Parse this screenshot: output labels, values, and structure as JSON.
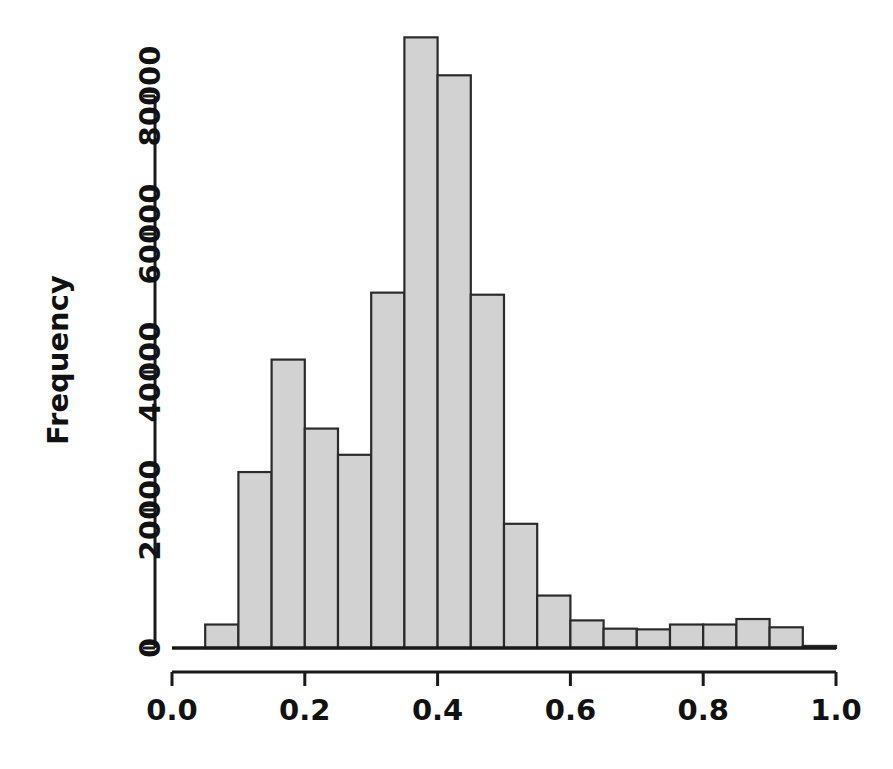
{
  "chart_data": {
    "type": "bar",
    "title": "",
    "subtitle": "",
    "xlabel": "",
    "ylabel": "Frequency",
    "grid": false,
    "legend": null,
    "legend_position": "none",
    "bin_width": 0.05,
    "xlim": [
      0.0,
      1.0
    ],
    "ylim": [
      0,
      88000
    ],
    "xticks": [
      "0.0",
      "0.2",
      "0.4",
      "0.6",
      "0.8",
      "1.0"
    ],
    "xtick_values": [
      0.0,
      0.2,
      0.4,
      0.6,
      0.8,
      1.0
    ],
    "yticks": [
      "0",
      "20000",
      "40000",
      "60000",
      "80000"
    ],
    "ytick_values": [
      0,
      20000,
      40000,
      60000,
      80000
    ],
    "categories": [
      "0.00-0.05",
      "0.05-0.10",
      "0.10-0.15",
      "0.15-0.20",
      "0.20-0.25",
      "0.25-0.30",
      "0.30-0.35",
      "0.35-0.40",
      "0.40-0.45",
      "0.45-0.50",
      "0.50-0.55",
      "0.55-0.60",
      "0.60-0.65",
      "0.65-0.70",
      "0.70-0.75",
      "0.75-0.80",
      "0.80-0.85",
      "0.85-0.90",
      "0.90-0.95",
      "0.95-1.00"
    ],
    "bin_starts": [
      0.0,
      0.05,
      0.1,
      0.15,
      0.2,
      0.25,
      0.3,
      0.35,
      0.4,
      0.45,
      0.5,
      0.55,
      0.6,
      0.65,
      0.7,
      0.75,
      0.8,
      0.85,
      0.9,
      0.95
    ],
    "values": [
      0,
      3400,
      25500,
      41800,
      31800,
      28000,
      51500,
      88500,
      83000,
      51200,
      18000,
      7600,
      4000,
      2800,
      2700,
      3400,
      3400,
      4200,
      3000,
      300
    ],
    "colors": {
      "bar_fill": "#d2d2d2",
      "bar_border": "#2b2b2b",
      "axis": "#1a1a1a",
      "text": "#111111",
      "background": "#ffffff"
    }
  },
  "plot": {
    "y_axis_title": "Frequency"
  }
}
